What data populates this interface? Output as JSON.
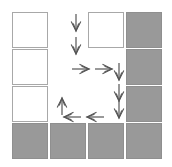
{
  "figure": {
    "title": "",
    "width": 172,
    "height": 167,
    "background_color": "#ffffff"
  },
  "palette": {
    "white_tile_fill": "#ffffff",
    "white_tile_border": "#a8a8a8",
    "gray_tile_fill": "#999999",
    "gray_tile_border": "#8f8f8f",
    "arrow_color": "#555555"
  },
  "grid": {
    "rows": 4,
    "cols": 4,
    "cell_size": 36,
    "origin_x": 12,
    "origin_y": 12,
    "step_x": 38,
    "step_y": 37,
    "tiles": [
      {
        "id": "r0c0",
        "row": 0,
        "col": 0,
        "state": "white"
      },
      {
        "id": "r0c1",
        "row": 0,
        "col": 1,
        "state": "empty"
      },
      {
        "id": "r0c2",
        "row": 0,
        "col": 2,
        "state": "white"
      },
      {
        "id": "r0c3",
        "row": 0,
        "col": 3,
        "state": "gray"
      },
      {
        "id": "r1c0",
        "row": 1,
        "col": 0,
        "state": "white"
      },
      {
        "id": "r1c1",
        "row": 1,
        "col": 1,
        "state": "empty"
      },
      {
        "id": "r1c2",
        "row": 1,
        "col": 2,
        "state": "empty"
      },
      {
        "id": "r1c3",
        "row": 1,
        "col": 3,
        "state": "gray"
      },
      {
        "id": "r2c0",
        "row": 2,
        "col": 0,
        "state": "white"
      },
      {
        "id": "r2c1",
        "row": 2,
        "col": 1,
        "state": "empty"
      },
      {
        "id": "r2c2",
        "row": 2,
        "col": 2,
        "state": "empty"
      },
      {
        "id": "r2c3",
        "row": 2,
        "col": 3,
        "state": "gray"
      },
      {
        "id": "r3c0",
        "row": 3,
        "col": 0,
        "state": "gray"
      },
      {
        "id": "r3c1",
        "row": 3,
        "col": 1,
        "state": "gray"
      },
      {
        "id": "r3c2",
        "row": 3,
        "col": 2,
        "state": "gray"
      },
      {
        "id": "r3c3",
        "row": 3,
        "col": 3,
        "state": "gray"
      }
    ]
  },
  "path": {
    "label": "",
    "arrow_count": 10,
    "arrows": [
      {
        "id": "a1",
        "direction": "down",
        "x": 69,
        "y": 14
      },
      {
        "id": "a2",
        "direction": "down",
        "x": 69,
        "y": 37
      },
      {
        "id": "a3",
        "direction": "right",
        "x": 74,
        "y": 60
      },
      {
        "id": "a4",
        "direction": "right",
        "x": 97,
        "y": 60
      },
      {
        "id": "a5",
        "direction": "down",
        "x": 112,
        "y": 63
      },
      {
        "id": "a6",
        "direction": "down",
        "x": 112,
        "y": 84
      },
      {
        "id": "a7",
        "direction": "down",
        "x": 112,
        "y": 101
      },
      {
        "id": "a8",
        "direction": "left",
        "x": 88,
        "y": 108
      },
      {
        "id": "a9",
        "direction": "left",
        "x": 65,
        "y": 108
      },
      {
        "id": "a10",
        "direction": "up",
        "x": 55,
        "y": 97
      }
    ]
  }
}
